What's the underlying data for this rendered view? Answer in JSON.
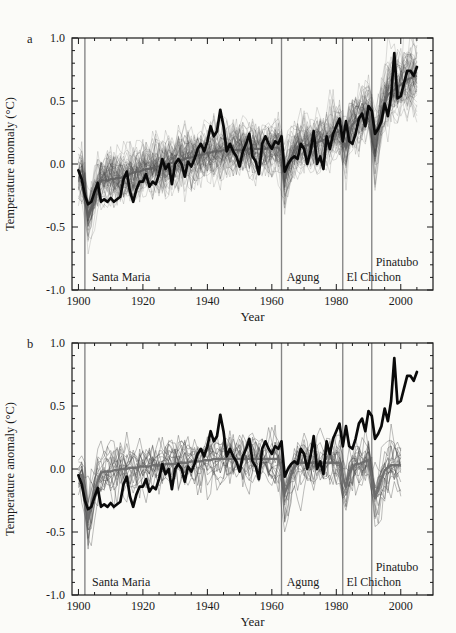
{
  "panels": [
    {
      "letter": "a",
      "ylabel": "Temperature anomaly (°C)",
      "xlabel": "Year"
    },
    {
      "letter": "b",
      "ylabel": "Temperature anomaly (°C)",
      "xlabel": "Year"
    }
  ],
  "volcanoes": [
    {
      "name": "Santa Maria",
      "year": 1902,
      "label_year": 1904.2,
      "label_anom": -0.9
    },
    {
      "name": "Agung",
      "year": 1963,
      "label_year": 1964.6,
      "label_anom": -0.9
    },
    {
      "name": "El Chichon",
      "year": 1982,
      "label_year": 1983.2,
      "label_anom": -0.9
    },
    {
      "name": "Pinatubo",
      "year": 1991,
      "label_year": 1992.2,
      "label_anom": -0.78
    }
  ],
  "chart_data": [
    {
      "panel": "a",
      "type": "line",
      "title": "Models with anthropogenic and natural forcings vs observations",
      "xlabel": "Year",
      "ylabel": "Temperature anomaly (°C)",
      "xlim": [
        1898,
        2010
      ],
      "ylim": [
        -1.0,
        1.0
      ],
      "grid": false,
      "x_major_ticks": [
        1900,
        1920,
        1940,
        1960,
        1980,
        2000
      ],
      "x_minor_step": 5,
      "y_major_ticks": [
        1.0,
        0.5,
        0.0,
        -0.5,
        -1.0
      ],
      "y_major_labels": [
        "1.0",
        "0.5",
        "0.0",
        "-0.5",
        "-1.0"
      ],
      "y_minor_step": 0.1,
      "observations": {
        "name": "Observations",
        "year_start": 1900,
        "values": [
          -0.05,
          -0.12,
          -0.25,
          -0.32,
          -0.3,
          -0.22,
          -0.15,
          -0.3,
          -0.28,
          -0.3,
          -0.27,
          -0.3,
          -0.28,
          -0.26,
          -0.12,
          -0.06,
          -0.22,
          -0.3,
          -0.2,
          -0.14,
          -0.14,
          -0.08,
          -0.18,
          -0.14,
          -0.16,
          -0.08,
          0.04,
          -0.04,
          0.0,
          -0.16,
          0.0,
          0.04,
          0.0,
          -0.1,
          0.02,
          -0.02,
          0.04,
          0.12,
          0.16,
          0.1,
          0.18,
          0.3,
          0.22,
          0.26,
          0.43,
          0.3,
          0.1,
          0.16,
          0.1,
          0.06,
          -0.02,
          0.1,
          0.16,
          0.24,
          0.06,
          0.02,
          -0.08,
          0.16,
          0.22,
          0.16,
          0.12,
          0.18,
          0.16,
          0.22,
          -0.06,
          0.0,
          0.04,
          0.06,
          0.04,
          0.16,
          0.12,
          0.0,
          0.1,
          0.26,
          0.0,
          0.06,
          -0.04,
          0.22,
          0.12,
          0.24,
          0.3,
          0.36,
          0.18,
          0.34,
          0.18,
          0.16,
          0.24,
          0.36,
          0.4,
          0.3,
          0.46,
          0.42,
          0.24,
          0.28,
          0.34,
          0.48,
          0.38,
          0.54,
          0.88,
          0.52,
          0.54,
          0.64,
          0.74,
          0.74,
          0.7,
          0.77
        ]
      },
      "ensemble_mean_trend": [
        -0.1,
        -0.11,
        -0.12,
        -0.13,
        -0.13,
        -0.13,
        -0.13,
        -0.13,
        -0.13,
        -0.13,
        -0.12,
        -0.12,
        -0.11,
        -0.11,
        -0.1,
        -0.09,
        -0.08,
        -0.07,
        -0.06,
        -0.06,
        -0.05,
        -0.04,
        -0.04,
        -0.03,
        -0.02,
        -0.02,
        -0.01,
        0.0,
        0.0,
        0.01,
        0.02,
        0.03,
        0.03,
        0.04,
        0.05,
        0.05,
        0.06,
        0.07,
        0.07,
        0.08,
        0.09,
        0.09,
        0.1,
        0.1,
        0.1,
        0.11,
        0.11,
        0.11,
        0.11,
        0.11,
        0.11,
        0.11,
        0.11,
        0.12,
        0.12,
        0.12,
        0.12,
        0.12,
        0.12,
        0.13,
        0.13,
        0.13,
        0.13,
        0.13,
        0.13,
        0.13,
        0.13,
        0.13,
        0.14,
        0.14,
        0.14,
        0.15,
        0.15,
        0.16,
        0.17,
        0.18,
        0.19,
        0.2,
        0.22,
        0.23,
        0.25,
        0.26,
        0.28,
        0.29,
        0.31,
        0.33,
        0.34,
        0.36,
        0.38,
        0.4,
        0.42,
        0.44,
        0.46,
        0.48,
        0.5,
        0.52,
        0.55,
        0.57,
        0.59,
        0.61,
        0.63,
        0.65,
        0.67,
        0.68,
        0.69,
        0.7
      ],
      "volcanic_response": {
        "1902": -0.1,
        "1903": -0.3,
        "1904": -0.22,
        "1905": -0.12,
        "1906": -0.05,
        "1963": -0.04,
        "1964": -0.24,
        "1965": -0.16,
        "1966": -0.08,
        "1967": -0.03,
        "1982": -0.1,
        "1983": -0.16,
        "1984": -0.06,
        "1985": -0.02,
        "1991": -0.12,
        "1992": -0.32,
        "1993": -0.2,
        "1994": -0.1,
        "1995": -0.04
      },
      "ensemble": {
        "members": 55,
        "year_start": 1900,
        "year_end": 2005,
        "noise_sd": 0.085,
        "ar": 0.5,
        "trend_scale": [
          0.78,
          1.28
        ],
        "volc_scale": [
          0.7,
          1.35
        ],
        "offset": 0.05,
        "seed": 11,
        "style": {
          "color": "#3d3d3d",
          "opacity": 0.17,
          "width": 1.0
        }
      },
      "ensemble_mean_style": {
        "color": "#606060",
        "opacity": 0.9,
        "width": 2.2
      },
      "observations_style": {
        "color": "#0a0a0a",
        "width": 2.7
      }
    },
    {
      "panel": "b",
      "type": "line",
      "title": "Models with natural forcings only vs observations",
      "xlabel": "Year",
      "ylabel": "Temperature anomaly (°C)",
      "xlim": [
        1898,
        2010
      ],
      "ylim": [
        -1.0,
        1.0
      ],
      "grid": false,
      "x_major_ticks": [
        1900,
        1920,
        1940,
        1960,
        1980,
        2000
      ],
      "x_minor_step": 5,
      "y_major_ticks": [
        1.0,
        0.5,
        0.0,
        -0.5,
        -1.0
      ],
      "y_major_labels": [
        "1.0",
        "0.5",
        "0.0",
        "-0.5",
        "-1.0"
      ],
      "y_minor_step": 0.1,
      "observations": {
        "name": "Observations",
        "year_start": 1900,
        "values": [
          -0.05,
          -0.12,
          -0.25,
          -0.32,
          -0.3,
          -0.22,
          -0.15,
          -0.3,
          -0.28,
          -0.3,
          -0.27,
          -0.3,
          -0.28,
          -0.26,
          -0.12,
          -0.06,
          -0.22,
          -0.3,
          -0.2,
          -0.14,
          -0.14,
          -0.08,
          -0.18,
          -0.14,
          -0.16,
          -0.08,
          0.04,
          -0.04,
          0.0,
          -0.16,
          0.0,
          0.04,
          0.0,
          -0.1,
          0.02,
          -0.02,
          0.04,
          0.12,
          0.16,
          0.1,
          0.18,
          0.3,
          0.22,
          0.26,
          0.43,
          0.3,
          0.1,
          0.16,
          0.1,
          0.06,
          -0.02,
          0.1,
          0.16,
          0.24,
          0.06,
          0.02,
          -0.08,
          0.16,
          0.22,
          0.16,
          0.12,
          0.18,
          0.16,
          0.22,
          -0.06,
          0.0,
          0.04,
          0.06,
          0.04,
          0.16,
          0.12,
          0.0,
          0.1,
          0.26,
          0.0,
          0.06,
          -0.04,
          0.22,
          0.12,
          0.24,
          0.3,
          0.36,
          0.18,
          0.34,
          0.18,
          0.16,
          0.24,
          0.36,
          0.4,
          0.3,
          0.46,
          0.42,
          0.24,
          0.28,
          0.34,
          0.48,
          0.38,
          0.54,
          0.88,
          0.52,
          0.54,
          0.64,
          0.74,
          0.74,
          0.7,
          0.77
        ]
      },
      "ensemble_mean_trend": [
        -0.05,
        -0.05,
        -0.05,
        -0.05,
        -0.04,
        -0.04,
        -0.03,
        -0.03,
        -0.02,
        -0.02,
        -0.02,
        -0.01,
        -0.01,
        0.0,
        0.0,
        0.0,
        0.01,
        0.01,
        0.01,
        0.02,
        0.02,
        0.02,
        0.02,
        0.03,
        0.03,
        0.03,
        0.03,
        0.04,
        0.04,
        0.04,
        0.04,
        0.05,
        0.05,
        0.05,
        0.05,
        0.06,
        0.06,
        0.06,
        0.06,
        0.07,
        0.07,
        0.07,
        0.08,
        0.08,
        0.08,
        0.08,
        0.08,
        0.08,
        0.08,
        0.08,
        0.08,
        0.08,
        0.08,
        0.08,
        0.08,
        0.08,
        0.08,
        0.08,
        0.08,
        0.08,
        0.08,
        0.08,
        0.08,
        0.07,
        0.07,
        0.06,
        0.06,
        0.05,
        0.05,
        0.05,
        0.05,
        0.05,
        0.05,
        0.05,
        0.05,
        0.05,
        0.05,
        0.05,
        0.05,
        0.05,
        0.05,
        0.05,
        0.05,
        0.04,
        0.04,
        0.04,
        0.04,
        0.04,
        0.05,
        0.06,
        0.07,
        0.07,
        0.06,
        0.05,
        0.04,
        0.04,
        0.03,
        0.03,
        0.03,
        0.03,
        0.03
      ],
      "volcanic_response": {
        "1902": -0.12,
        "1903": -0.35,
        "1904": -0.26,
        "1905": -0.14,
        "1906": -0.06,
        "1963": -0.05,
        "1964": -0.26,
        "1965": -0.18,
        "1966": -0.1,
        "1967": -0.04,
        "1982": -0.12,
        "1983": -0.18,
        "1984": -0.08,
        "1985": -0.03,
        "1991": -0.14,
        "1992": -0.28,
        "1993": -0.22,
        "1994": -0.12,
        "1995": -0.05,
        "1996": -0.02
      },
      "ensemble": {
        "members": 19,
        "year_start": 1900,
        "year_end": 2000,
        "noise_sd": 0.08,
        "ar": 0.5,
        "trend_scale": [
          0.7,
          1.3
        ],
        "volc_scale": [
          0.7,
          1.4
        ],
        "offset": 0.06,
        "seed": 77,
        "style": {
          "color": "#4a4a4a",
          "opacity": 0.4,
          "width": 0.9
        }
      },
      "ensemble_mean_style": {
        "color": "#6b6b6b",
        "opacity": 0.95,
        "width": 2.4
      },
      "observations_style": {
        "color": "#0a0a0a",
        "width": 2.7
      }
    }
  ]
}
